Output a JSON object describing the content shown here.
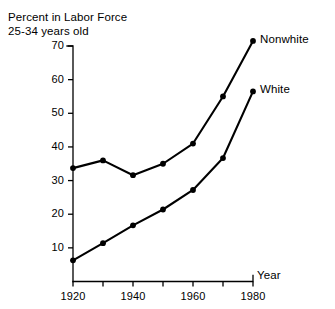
{
  "chart_data": {
    "type": "line",
    "title": "Percent in Labor Force",
    "subtitle": "25-34 years old",
    "xlabel": "Year",
    "ylabel": "",
    "x": [
      1920,
      1930,
      1940,
      1950,
      1960,
      1970,
      1980
    ],
    "xlim": [
      1920,
      1980
    ],
    "ylim": [
      0,
      70
    ],
    "grid": false,
    "legend_position": "right-inline",
    "x_tick_values": [
      1920,
      1930,
      1940,
      1950,
      1960,
      1970,
      1980
    ],
    "x_tick_labels": [
      "1920",
      "",
      "1940",
      "",
      "1960",
      "",
      "1980"
    ],
    "y_tick_values": [
      10,
      20,
      30,
      40,
      50,
      60,
      70
    ],
    "y_tick_labels": [
      "10",
      "20",
      "30",
      "40",
      "50",
      "60",
      "70"
    ],
    "series": [
      {
        "name": "Nonwhite",
        "color": "#000000",
        "values": [
          33.7,
          36.0,
          31.6,
          35.0,
          41.0,
          55.0,
          71.5
        ]
      },
      {
        "name": "White",
        "color": "#000000",
        "values": [
          6.3,
          11.4,
          16.7,
          21.4,
          27.2,
          36.7,
          56.5
        ]
      }
    ]
  }
}
